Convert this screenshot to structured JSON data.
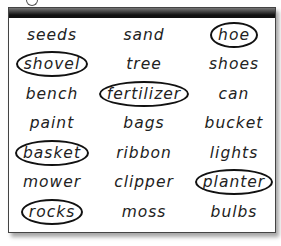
{
  "worksheet": {
    "words": [
      [
        {
          "text": "seeds",
          "circled": false
        },
        {
          "text": "sand",
          "circled": false
        },
        {
          "text": "hoe",
          "circled": true
        }
      ],
      [
        {
          "text": "shovel",
          "circled": true
        },
        {
          "text": "tree",
          "circled": false
        },
        {
          "text": "shoes",
          "circled": false
        }
      ],
      [
        {
          "text": "bench",
          "circled": false
        },
        {
          "text": "fertilizer",
          "circled": true
        },
        {
          "text": "can",
          "circled": false
        }
      ],
      [
        {
          "text": "paint",
          "circled": false
        },
        {
          "text": "bags",
          "circled": false
        },
        {
          "text": "bucket",
          "circled": false
        }
      ],
      [
        {
          "text": "basket",
          "circled": true
        },
        {
          "text": "ribbon",
          "circled": false
        },
        {
          "text": "lights",
          "circled": false
        }
      ],
      [
        {
          "text": "mower",
          "circled": false
        },
        {
          "text": "clipper",
          "circled": false
        },
        {
          "text": "planter",
          "circled": true
        }
      ],
      [
        {
          "text": "rocks",
          "circled": true
        },
        {
          "text": "moss",
          "circled": false
        },
        {
          "text": "bulbs",
          "circled": false
        }
      ]
    ],
    "colors": {
      "ink": "#222222",
      "circle": "#111111",
      "topbar": "#111111",
      "border": "#444444"
    }
  }
}
